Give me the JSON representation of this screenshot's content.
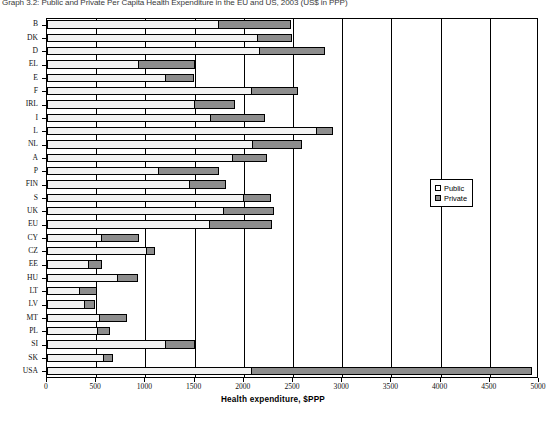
{
  "chart_data": {
    "type": "bar",
    "orientation": "horizontal",
    "stacked": true,
    "title": "Graph 3.2: Public and Private Per Capita Health Expenditure in the EU and US, 2003 (US$ in PPP)",
    "xlabel": "Health expenditure, $PPP",
    "ylabel": "",
    "xlim": [
      0,
      5000
    ],
    "xticks": [
      0,
      500,
      1000,
      1500,
      2000,
      2500,
      3000,
      3500,
      4000,
      4500,
      5000
    ],
    "xtick_labels": [
      "0",
      "500",
      "1000",
      "1500",
      "2000",
      "2500",
      "3000",
      "3500",
      "4000",
      "4500",
      "5000"
    ],
    "grid": true,
    "grid_axis": "x",
    "legend_position": "center-right",
    "categories": [
      "B",
      "DK",
      "D",
      "EL",
      "E",
      "F",
      "IRL",
      "I",
      "L",
      "NL",
      "A",
      "P",
      "FIN",
      "S",
      "UK",
      "EU",
      "CY",
      "CZ",
      "EE",
      "HU",
      "LT",
      "LV",
      "MT",
      "PL",
      "SI",
      "SK",
      "USA"
    ],
    "series": [
      {
        "name": "Public",
        "color": "#f2f2f2",
        "values": [
          1750,
          2140,
          2160,
          940,
          1210,
          2080,
          1500,
          1670,
          2740,
          2090,
          1890,
          1140,
          1450,
          2000,
          1800,
          1660,
          560,
          1020,
          430,
          720,
          340,
          390,
          540,
          520,
          1210,
          580,
          2080
        ]
      },
      {
        "name": "Private",
        "color": "#8d8d8d",
        "values": [
          740,
          360,
          680,
          570,
          290,
          480,
          420,
          560,
          180,
          510,
          360,
          620,
          380,
          290,
          520,
          640,
          390,
          90,
          140,
          220,
          180,
          110,
          280,
          130,
          300,
          100,
          2860
        ]
      }
    ],
    "totals": [
      2490,
      2500,
      2840,
      1510,
      1500,
      2560,
      1920,
      2230,
      2920,
      2600,
      2250,
      1760,
      1830,
      2290,
      2320,
      2300,
      950,
      1110,
      570,
      940,
      520,
      500,
      820,
      650,
      1510,
      680,
      4940
    ]
  },
  "legend": {
    "items": [
      {
        "label": "Public",
        "swatch": "public-swatch"
      },
      {
        "label": "Private",
        "swatch": "private-swatch"
      }
    ]
  }
}
